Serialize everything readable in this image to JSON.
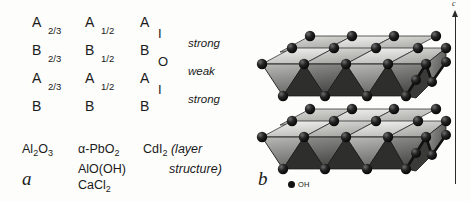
{
  "figure": {
    "background_color": "#fdfdfc",
    "ink_color": "#1a1a1a"
  },
  "panel_a": {
    "label": "a",
    "columns": [
      {
        "name": "occupancy-two-thirds",
        "rows": [
          {
            "letter": "A",
            "fraction": "2/3"
          },
          {
            "letter": "B",
            "fraction": "2/3"
          },
          {
            "letter": "A",
            "fraction": "2/3"
          },
          {
            "letter": "B",
            "fraction": ""
          }
        ]
      },
      {
        "name": "occupancy-one-half",
        "rows": [
          {
            "letter": "A",
            "fraction": "1/2"
          },
          {
            "letter": "B",
            "fraction": "1/2"
          },
          {
            "letter": "A",
            "fraction": "1/2"
          },
          {
            "letter": "B",
            "fraction": ""
          }
        ]
      },
      {
        "name": "occupancy-layer",
        "rows": [
          {
            "letter": "A",
            "symbol": "I"
          },
          {
            "letter": "B",
            "symbol": "O"
          },
          {
            "letter": "A",
            "symbol": "I"
          },
          {
            "letter": "B",
            "symbol": ""
          }
        ]
      }
    ],
    "strengths": [
      "strong",
      "weak",
      "strong"
    ],
    "formulas": [
      {
        "name": "formula-column-1",
        "items": [
          {
            "text": "Al",
            "sub": "2"
          },
          {
            "text": "O",
            "sub": "3"
          }
        ]
      },
      {
        "name": "formula-column-2",
        "lines": [
          "α-PbO2",
          "AlO(OH)",
          "CaCl2"
        ]
      },
      {
        "name": "formula-column-3",
        "lines": [
          "CdI2",
          "(layer",
          "structure)"
        ]
      }
    ],
    "formula_1_text": "Al2O3",
    "formula_2_line_1_main": "α-PbO",
    "formula_2_line_1_sub": "2",
    "formula_2_line_2": "AlO(OH)",
    "formula_2_line_3_main": "CaCl",
    "formula_2_line_3_sub": "2",
    "formula_3_main": "CdI",
    "formula_3_sub": "2",
    "formula_3_note_1": "(layer",
    "formula_3_note_2": "structure)"
  },
  "panel_b": {
    "label": "b",
    "description": "Two stacked sheets of edge-sharing octahedra, ball-and-stick with shaded polyhedral faces",
    "legend": {
      "marker": "filled-circle",
      "label": "OH"
    },
    "axis": {
      "label": "c",
      "direction": "up"
    },
    "layer_count": 2,
    "colors": {
      "sphere": "#141414",
      "face_top_light": "#e8e8e6",
      "face_top_mid": "#c9c9c6",
      "face_front_dark": "#6f6f6d",
      "face_front_darker": "#4a4a49",
      "edge": "#1b1b1b"
    }
  }
}
